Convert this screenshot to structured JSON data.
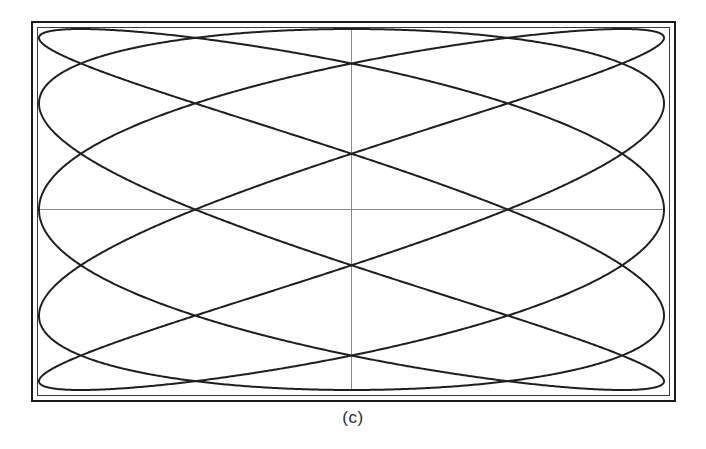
{
  "figure": {
    "caption": "(c)",
    "kind": "lissajous-oscilloscope-trace",
    "background_color": "#ffffff",
    "trace_color": "#1f1f1f",
    "graticule_color": "#8a8a8a",
    "bezel_color": "#1a1a1a",
    "screen_border_color": "#3a3a3a"
  },
  "scope": {
    "bezel": {
      "x": 31,
      "y": 21,
      "width": 645,
      "height": 381
    },
    "screen": {
      "x": 36,
      "y": 26,
      "width": 635,
      "height": 371
    },
    "graticule": {
      "vertical_center_x": 356,
      "horizontal_center_y": 212,
      "line_width": 1
    },
    "trace": {
      "line_width": 2,
      "sample_count": 4000
    }
  },
  "chart_data": {
    "type": "line",
    "title": "",
    "subtitle": "",
    "xlabel": "",
    "ylabel": "",
    "annotations": [
      "(c)"
    ],
    "legend_position": "none",
    "grid": true,
    "parametric": {
      "curve": "lissajous",
      "x_expression": "A * sin(a*t + delta)",
      "y_expression": "B * sin(b*t)",
      "a": 5,
      "b": 3,
      "delta_radians": 1.5707963,
      "delta_label": "pi/2",
      "amplitude_x": 1.0,
      "amplitude_y": 1.0,
      "t_start": 0,
      "t_end": 6.2831853,
      "frequency_ratio": "5:3",
      "horizontal_tangent_lobes": 5,
      "vertical_tangent_lobes": 3
    },
    "xlim": [
      -1,
      1
    ],
    "ylim": [
      -1,
      1
    ]
  }
}
